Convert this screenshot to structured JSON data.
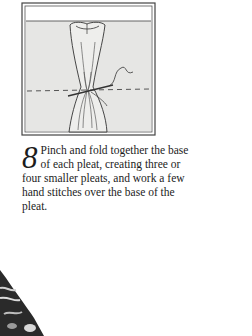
{
  "illustration": {
    "description": "fabric pleat pinched and stitched at base with needle and thread",
    "dashed_line": "stitch-guide"
  },
  "step": {
    "number": "8",
    "text": "Pinch and fold together the base of each pleat, creating three or four smaller pleats, and work a few hand stitches over the base of the pleat."
  },
  "colors": {
    "fabric": "#e6e6e4",
    "line": "#3a3a3a",
    "photo_dark": "#2a2a2a"
  }
}
